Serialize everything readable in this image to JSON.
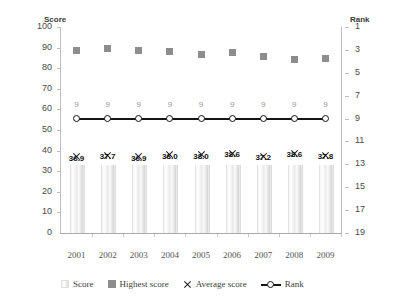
{
  "chart_data": {
    "type": "bar",
    "title": "",
    "xlabel": "",
    "ylabel": "Score",
    "y2label": "Rank",
    "categories": [
      "2001",
      "2002",
      "2003",
      "2004",
      "2005",
      "2006",
      "2007",
      "2008",
      "2009"
    ],
    "ylim": [
      0,
      100
    ],
    "yticks": [
      100,
      90,
      80,
      70,
      60,
      50,
      40,
      30,
      20,
      10,
      0
    ],
    "y2lim": [
      19,
      1
    ],
    "y2ticks": [
      1,
      3,
      5,
      7,
      9,
      11,
      13,
      15,
      17,
      19
    ],
    "y2_inverted": true,
    "grid": false,
    "legend_position": "bottom",
    "series": [
      {
        "name": "Score",
        "type": "bar",
        "axis": "left",
        "values": [
          33.0,
          33.0,
          33.0,
          33.0,
          33.0,
          33.0,
          33.0,
          33.0,
          33.0
        ]
      },
      {
        "name": "Highest score",
        "type": "scatter",
        "axis": "left",
        "values": [
          88.5,
          89.6,
          88.6,
          87.9,
          86.6,
          87.6,
          85.6,
          84.1,
          84.6
        ]
      },
      {
        "name": "Average score",
        "type": "scatter",
        "axis": "left",
        "values": [
          36.9,
          37.7,
          36.9,
          38.0,
          38.0,
          38.6,
          37.2,
          38.6,
          37.8
        ],
        "labels": [
          "36.9",
          "37.7",
          "36.9",
          "38.0",
          "38.0",
          "38.6",
          "37.2",
          "38.6",
          "37.8"
        ]
      },
      {
        "name": "Rank",
        "type": "line",
        "axis": "right",
        "values": [
          9,
          9,
          9,
          9,
          9,
          9,
          9,
          9,
          9
        ],
        "labels": [
          "9",
          "9",
          "9",
          "9",
          "9",
          "9",
          "9",
          "9",
          "9"
        ]
      }
    ]
  },
  "axes": {
    "left_title": "Score",
    "right_title": "Rank"
  },
  "legend": {
    "entries": [
      {
        "label": "Score",
        "marker": "bar-swatch-icon"
      },
      {
        "label": "Highest score",
        "marker": "square-marker-icon"
      },
      {
        "label": "Average score",
        "marker": "x-marker-icon"
      },
      {
        "label": "Rank",
        "marker": "line-marker-icon"
      }
    ]
  },
  "colors": {
    "highest_score_marker": "#8d8d8d",
    "rank_line": "#151515",
    "average_marker": "#1a1a1a",
    "axis": "#bdbdbd",
    "tick_text": "#4a4a4a",
    "rank_label_text": "#9a9a9a"
  }
}
